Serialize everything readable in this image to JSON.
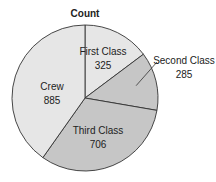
{
  "chart_data": {
    "type": "pie",
    "title": "Count",
    "categories": [
      "First Class",
      "Second Class",
      "Third Class",
      "Crew"
    ],
    "values": [
      325,
      285,
      706,
      885
    ],
    "total": 2201,
    "start_angle": "12 o'clock",
    "direction": "clockwise",
    "colors": [
      "#e6e6e6",
      "#c6c6c6",
      "#c6c6c6",
      "#e6e6e6"
    ],
    "outline_color": "#333333",
    "legend": "none (inline labels)",
    "labels": [
      {
        "name": "First Class",
        "value": "325",
        "placement": "inside"
      },
      {
        "name": "Second Class",
        "value": "285",
        "placement": "outside with leader line"
      },
      {
        "name": "Third Class",
        "value": "706",
        "placement": "inside"
      },
      {
        "name": "Crew",
        "value": "885",
        "placement": "inside"
      }
    ]
  }
}
